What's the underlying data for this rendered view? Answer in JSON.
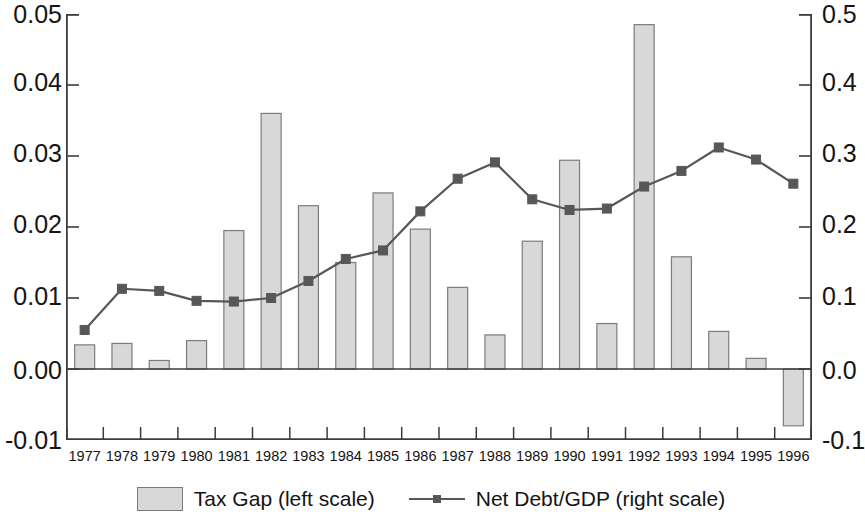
{
  "chart_data": {
    "type": "bar",
    "title": "",
    "xlabel": "",
    "ylabel": "",
    "grid": false,
    "legend_position": "bottom-center",
    "categories": [
      "1977",
      "1978",
      "1979",
      "1980",
      "1981",
      "1982",
      "1983",
      "1984",
      "1985",
      "1986",
      "1987",
      "1988",
      "1989",
      "1990",
      "1991",
      "1992",
      "1993",
      "1994",
      "1995",
      "1996"
    ],
    "left_axis": {
      "label": "Tax Gap (left scale)",
      "ylim": [
        -0.01,
        0.05
      ],
      "ticks": [
        "-0.01",
        "0.00",
        "0.01",
        "0.02",
        "0.03",
        "0.04",
        "0.05"
      ],
      "tick_values": [
        -0.01,
        0.0,
        0.01,
        0.02,
        0.03,
        0.04,
        0.05
      ]
    },
    "right_axis": {
      "label": "Net Debt/GDP (right scale)",
      "ylim": [
        -0.1,
        0.5
      ],
      "ticks": [
        "-0.1",
        "0.0",
        "0.1",
        "0.2",
        "0.3",
        "0.4",
        "0.5"
      ],
      "tick_values": [
        -0.1,
        0.0,
        0.1,
        0.2,
        0.3,
        0.4,
        0.5
      ]
    },
    "series": [
      {
        "name": "Tax Gap (left scale)",
        "type": "bar",
        "axis": "left",
        "color": "#d8d8d8",
        "edge_color": "#7c7c7c",
        "values": [
          0.0034,
          0.0036,
          0.0012,
          0.004,
          0.0195,
          0.036,
          0.023,
          0.015,
          0.0248,
          0.0197,
          0.0115,
          0.0048,
          0.018,
          0.0294,
          0.0064,
          0.0485,
          0.0158,
          0.0053,
          0.0015,
          -0.008
        ]
      },
      {
        "name": "Net Debt/GDP (right scale)",
        "type": "line",
        "axis": "right",
        "color": "#57575a",
        "marker": "square",
        "values": [
          0.055,
          0.113,
          0.11,
          0.096,
          0.095,
          0.1,
          0.124,
          0.155,
          0.167,
          0.222,
          0.268,
          0.291,
          0.239,
          0.224,
          0.226,
          0.257,
          0.279,
          0.312,
          0.295,
          0.261
        ]
      }
    ]
  },
  "legend": {
    "entries": [
      {
        "label": "Tax Gap (left scale)",
        "marker": "bar-swatch"
      },
      {
        "label": "Net Debt/GDP (right scale)",
        "marker": "line-swatch"
      }
    ]
  },
  "axis_labels": {
    "left": [
      "0.05",
      "0.04",
      "0.03",
      "0.02",
      "0.01",
      "0.00",
      "-0.01"
    ],
    "right": [
      "0.5",
      "0.4",
      "0.3",
      "0.2",
      "0.1",
      "0.0",
      "-0.1"
    ]
  },
  "colors": {
    "bar_fill": "#d8d8d8",
    "bar_edge": "#7c7c7c",
    "line": "#57575a",
    "axis": "#3c3c3c",
    "text": "#141414",
    "background": "#ffffff"
  }
}
